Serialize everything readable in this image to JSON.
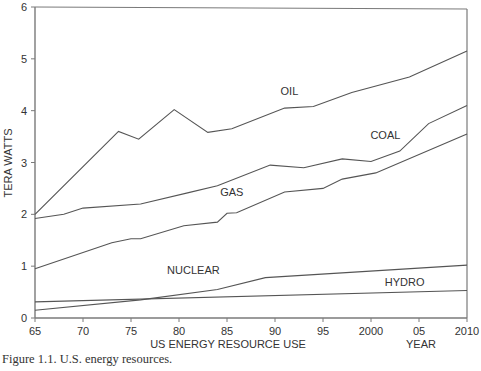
{
  "chart_data": {
    "type": "line",
    "title": "",
    "xlabel": "US ENERGY RESOURCE USE",
    "xlabel_right": "YEAR",
    "ylabel": "TERA WATTS",
    "caption": "Figure 1.1.  U.S. energy resources.",
    "xlim": [
      1965,
      2010
    ],
    "ylim": [
      0,
      6
    ],
    "grid": false,
    "legend": "inline labels",
    "x_ticks": [
      1965,
      1970,
      1975,
      1980,
      1985,
      1990,
      1995,
      2000,
      2005,
      2010
    ],
    "x_tick_labels": [
      "65",
      "70",
      "75",
      "80",
      "85",
      "90",
      "95",
      "2000",
      "05",
      "2010"
    ],
    "y_ticks": [
      0,
      1,
      2,
      3,
      4,
      5,
      6
    ],
    "y_tick_labels": [
      "0",
      "1",
      "2",
      "3",
      "4",
      "5",
      "6"
    ],
    "series": [
      {
        "name": "OIL",
        "label_pos": [
          1991.5,
          4.3
        ],
        "points": [
          [
            1965,
            2.0
          ],
          [
            1973.7,
            3.6
          ],
          [
            1975.8,
            3.45
          ],
          [
            1979.5,
            4.02
          ],
          [
            1983,
            3.58
          ],
          [
            1985.5,
            3.65
          ],
          [
            1991,
            4.05
          ],
          [
            1994,
            4.08
          ],
          [
            1998,
            4.35
          ],
          [
            2004,
            4.65
          ],
          [
            2010,
            5.15
          ]
        ]
      },
      {
        "name": "COAL",
        "label_pos": [
          2001.5,
          3.45
        ],
        "points": [
          [
            1965,
            1.92
          ],
          [
            1968,
            2.0
          ],
          [
            1970,
            2.12
          ],
          [
            1976,
            2.2
          ],
          [
            1981,
            2.42
          ],
          [
            1984,
            2.55
          ],
          [
            1989.5,
            2.95
          ],
          [
            1993,
            2.9
          ],
          [
            1997,
            3.07
          ],
          [
            2000,
            3.02
          ],
          [
            2003,
            3.22
          ],
          [
            2006,
            3.75
          ],
          [
            2010,
            4.1
          ]
        ]
      },
      {
        "name": "GAS",
        "label_pos": [
          1985.5,
          2.35
        ],
        "points": [
          [
            1965,
            0.95
          ],
          [
            1973,
            1.45
          ],
          [
            1975,
            1.53
          ],
          [
            1976,
            1.53
          ],
          [
            1980.5,
            1.78
          ],
          [
            1984,
            1.85
          ],
          [
            1985,
            2.02
          ],
          [
            1986,
            2.03
          ],
          [
            1991,
            2.43
          ],
          [
            1995,
            2.5
          ],
          [
            1997,
            2.68
          ],
          [
            2000.5,
            2.8
          ],
          [
            2010,
            3.55
          ]
        ]
      },
      {
        "name": "NUCLEAR",
        "label_pos": [
          1981.5,
          0.85
        ],
        "points": [
          [
            1965,
            0.15
          ],
          [
            1976,
            0.35
          ],
          [
            1984,
            0.55
          ],
          [
            1989,
            0.78
          ],
          [
            2010,
            1.02
          ]
        ]
      },
      {
        "name": "HYDRO",
        "label_pos": [
          2003.5,
          0.62
        ],
        "points": [
          [
            1965,
            0.31
          ],
          [
            2010,
            0.53
          ]
        ]
      }
    ]
  }
}
